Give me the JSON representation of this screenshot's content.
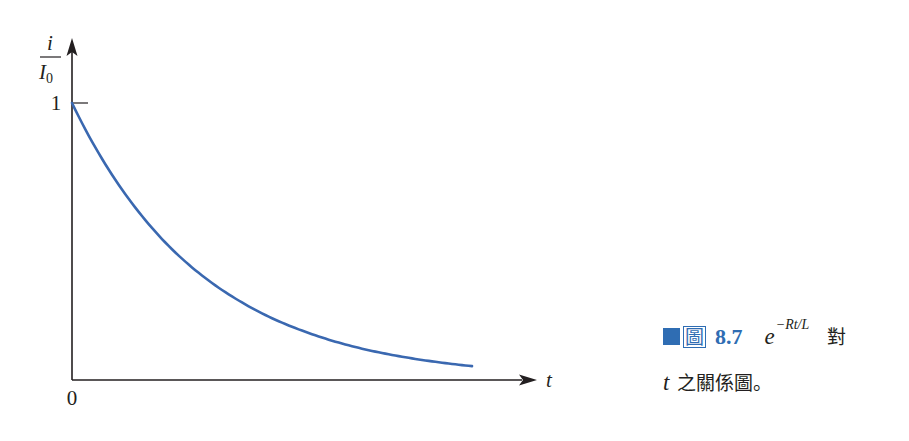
{
  "figure": {
    "caption": {
      "fig_label": "圖",
      "fig_number": "8.7",
      "expr_base": "e",
      "expr_exponent": "−Rt/L",
      "line1_tail": "對",
      "line2_var": "t",
      "line2_rest": "之關係圖。"
    },
    "colors": {
      "curve": "#3a68b0",
      "axis": "#231f20",
      "accent": "#2f6db3"
    }
  },
  "chart_data": {
    "type": "line",
    "title": "",
    "xlabel": "t",
    "ylabel_numerator": "i",
    "ylabel_denominator": "I",
    "ylabel_subscript": "0",
    "origin_label": "0",
    "y_ticks": [
      {
        "value": 1,
        "label": "1"
      }
    ],
    "xlim": [
      0,
      3
    ],
    "ylim": [
      0,
      1.2
    ],
    "grid": false,
    "legend": "none",
    "series": [
      {
        "name": "i/I0 = e^(-Rt/L)",
        "function": "exp(-x)",
        "x": [
          0,
          0.25,
          0.5,
          0.75,
          1.0,
          1.25,
          1.5,
          1.75,
          2.0,
          2.25,
          2.5,
          2.75,
          3.0
        ],
        "values": [
          1.0,
          0.779,
          0.607,
          0.472,
          0.368,
          0.287,
          0.223,
          0.174,
          0.135,
          0.105,
          0.082,
          0.064,
          0.05
        ]
      }
    ]
  }
}
